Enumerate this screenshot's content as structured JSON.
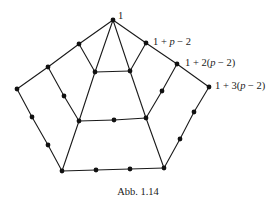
{
  "figure": {
    "caption": "Abb. 1.14",
    "labels": [
      {
        "id": "l0",
        "text": "1",
        "x": 118,
        "y": 19
      },
      {
        "id": "l1",
        "text": "1 + p − 2",
        "x": 153,
        "y": 45
      },
      {
        "id": "l2",
        "text": "1 + 2(p − 2)",
        "x": 185,
        "y": 66
      },
      {
        "id": "l3",
        "text": "1 + 3(p − 2)",
        "x": 215,
        "y": 89
      }
    ],
    "nodes": [
      {
        "id": "top",
        "x": 113,
        "y": 20
      },
      {
        "id": "ls1",
        "x": 79,
        "y": 44
      },
      {
        "id": "ls2",
        "x": 48,
        "y": 67
      },
      {
        "id": "ls3",
        "x": 17,
        "y": 89
      },
      {
        "id": "rs1",
        "x": 146,
        "y": 43
      },
      {
        "id": "rs2",
        "x": 177,
        "y": 64
      },
      {
        "id": "rs3",
        "x": 209,
        "y": 87
      },
      {
        "id": "itl",
        "x": 95,
        "y": 72
      },
      {
        "id": "itr",
        "x": 130,
        "y": 71
      },
      {
        "id": "ldot",
        "x": 64,
        "y": 96
      },
      {
        "id": "rdot",
        "x": 162,
        "y": 91
      },
      {
        "id": "ibl",
        "x": 79,
        "y": 121
      },
      {
        "id": "imid",
        "x": 114,
        "y": 120
      },
      {
        "id": "ibr",
        "x": 146,
        "y": 118
      },
      {
        "id": "lo1",
        "x": 32,
        "y": 117
      },
      {
        "id": "lo2",
        "x": 48,
        "y": 145
      },
      {
        "id": "bl",
        "x": 62,
        "y": 171
      },
      {
        "id": "ro1",
        "x": 194,
        "y": 112
      },
      {
        "id": "ro2",
        "x": 180,
        "y": 139
      },
      {
        "id": "br",
        "x": 164,
        "y": 168
      },
      {
        "id": "bm1",
        "x": 96,
        "y": 170
      },
      {
        "id": "bm2",
        "x": 130,
        "y": 169
      }
    ],
    "edges": [
      [
        "top",
        "ls1"
      ],
      [
        "ls1",
        "ls2"
      ],
      [
        "ls2",
        "ls3"
      ],
      [
        "top",
        "rs1"
      ],
      [
        "rs1",
        "rs2"
      ],
      [
        "rs2",
        "rs3"
      ],
      [
        "top",
        "itl"
      ],
      [
        "top",
        "itr"
      ],
      [
        "ls1",
        "itl"
      ],
      [
        "rs1",
        "itr"
      ],
      [
        "itl",
        "itr"
      ],
      [
        "itl",
        "ibl"
      ],
      [
        "itr",
        "ibr"
      ],
      [
        "ls2",
        "ldot"
      ],
      [
        "ldot",
        "ibl"
      ],
      [
        "rs2",
        "rdot"
      ],
      [
        "rdot",
        "ibr"
      ],
      [
        "ibl",
        "imid"
      ],
      [
        "imid",
        "ibr"
      ],
      [
        "ls3",
        "lo1"
      ],
      [
        "lo1",
        "lo2"
      ],
      [
        "lo2",
        "bl"
      ],
      [
        "rs3",
        "ro1"
      ],
      [
        "ro1",
        "ro2"
      ],
      [
        "ro2",
        "br"
      ],
      [
        "ibl",
        "bl"
      ],
      [
        "ibr",
        "br"
      ],
      [
        "bl",
        "bm1"
      ],
      [
        "bm1",
        "bm2"
      ],
      [
        "bm2",
        "br"
      ]
    ],
    "node_radius": 2.4,
    "caption_pos": {
      "x": 138,
      "y": 195
    }
  }
}
